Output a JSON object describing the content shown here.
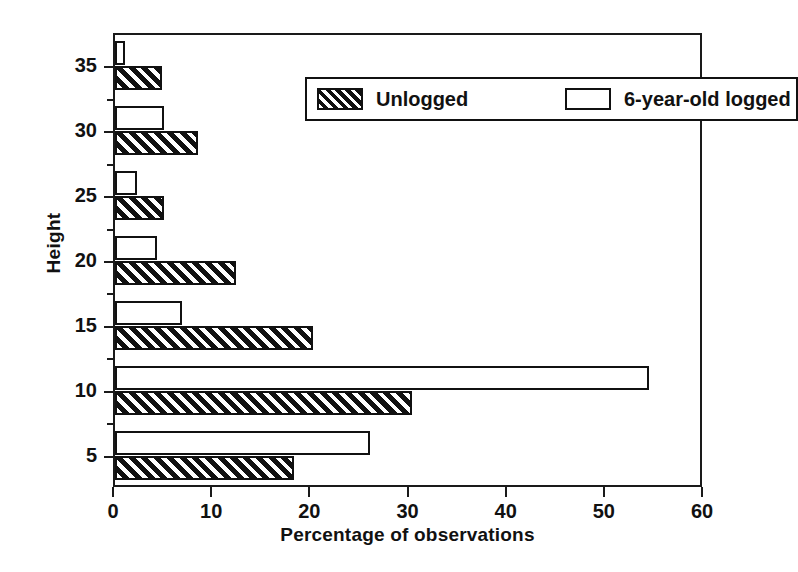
{
  "chart_data": {
    "type": "bar",
    "orientation": "horizontal",
    "title": "",
    "xlabel": "Percentage of observations",
    "ylabel": "Height",
    "xlim": [
      0,
      60
    ],
    "xticks": [
      0,
      10,
      20,
      30,
      40,
      50,
      60
    ],
    "xtick_labels": [
      "0",
      "10",
      "20",
      "30",
      "40",
      "50",
      "60"
    ],
    "ylim": [
      2.5,
      37.5
    ],
    "yticks": [
      5,
      10,
      15,
      20,
      25,
      30,
      35
    ],
    "ytick_labels": [
      "5",
      "10",
      "15",
      "20",
      "25",
      "30",
      "35"
    ],
    "yticks_minor": [
      7.5,
      12.5,
      17.5,
      22.5,
      27.5,
      32.5
    ],
    "grid": false,
    "legend_position": "top-right-inside",
    "categories": [
      5,
      10,
      15,
      20,
      25,
      30,
      35
    ],
    "series": [
      {
        "name": "Unlogged",
        "style": "hatched",
        "color": "#111111",
        "values": [
          18.2,
          30.3,
          20.2,
          12.3,
          5.0,
          8.5,
          4.8
        ]
      },
      {
        "name": "6-year-old logged",
        "style": "open",
        "color": "#ffffff",
        "values": [
          26.0,
          54.4,
          6.8,
          4.3,
          2.2,
          5.0,
          1.0
        ]
      }
    ]
  },
  "legend": {
    "items": [
      {
        "label": "Unlogged",
        "swatch": "hatched-swatch"
      },
      {
        "label": "6-year-old logged",
        "swatch": "open-swatch"
      }
    ]
  },
  "axes": {
    "x_title": "Percentage of observations",
    "y_title": "Height"
  }
}
